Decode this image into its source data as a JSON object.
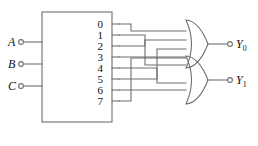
{
  "diagram": {
    "colors": {
      "wire": "#6f6f6f",
      "outline": "#6f6f6f",
      "text": "#111111",
      "background": "#ffffff"
    }
  },
  "decoder": {
    "name": "decoder-block",
    "inputs": [
      {
        "label": "A",
        "name": "input-a"
      },
      {
        "label": "B",
        "name": "input-b"
      },
      {
        "label": "C",
        "name": "input-c"
      }
    ],
    "outputs": [
      {
        "label": "0"
      },
      {
        "label": "1"
      },
      {
        "label": "2"
      },
      {
        "label": "3"
      },
      {
        "label": "4"
      },
      {
        "label": "5"
      },
      {
        "label": "6"
      },
      {
        "label": "7"
      }
    ]
  },
  "gates": [
    {
      "name": "or-gate-y0",
      "type": "OR",
      "input_count": 4,
      "driven_by": [
        "0",
        "2",
        "5",
        "7"
      ]
    },
    {
      "name": "or-gate-y1",
      "type": "OR",
      "input_count": 4,
      "driven_by": [
        "1",
        "3",
        "4",
        "6"
      ]
    }
  ],
  "outputs": [
    {
      "label": "Y",
      "subscript": "0",
      "name": "output-y0"
    },
    {
      "label": "Y",
      "subscript": "1",
      "name": "output-y1"
    }
  ]
}
